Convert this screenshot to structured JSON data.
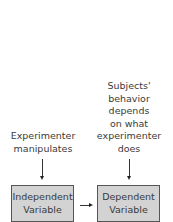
{
  "diagram": {
    "left_label": [
      "Experimenter",
      "manipulates"
    ],
    "right_label": [
      "Subjects'",
      "behavior",
      "depends",
      "on what",
      "experimenter",
      "does"
    ],
    "left_box": [
      "Independent",
      "Variable"
    ],
    "right_box": [
      "Dependent",
      "Variable"
    ],
    "colors": {
      "box_fill": "#d3d3d3",
      "box_border": "#555555",
      "text": "#3a3a3a"
    }
  }
}
